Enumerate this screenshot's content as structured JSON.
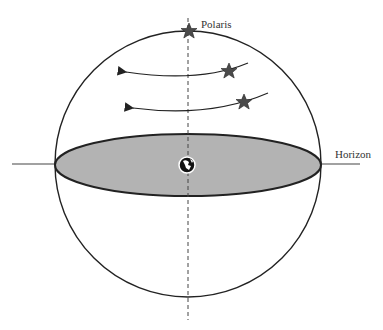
{
  "diagram": {
    "labels": {
      "polaris": "Polaris",
      "horizon": "Horizon"
    },
    "elements": {
      "celestial_sphere": "circle",
      "horizon_plane": "ellipse",
      "axis": "dashed-vertical-line",
      "earth_icon": "globe-icon",
      "stars": [
        "polaris-star",
        "star-upper",
        "star-lower"
      ],
      "arrows": [
        "arrow-upper",
        "arrow-lower"
      ]
    },
    "colors": {
      "stroke": "#222222",
      "plane_fill": "#b3b3b3",
      "star_fill": "#4a4a4a"
    }
  }
}
